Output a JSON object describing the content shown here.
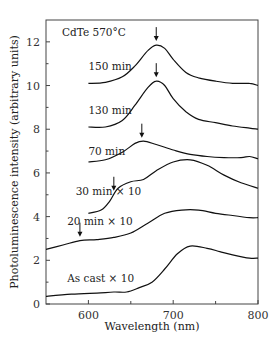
{
  "chart_data": {
    "type": "line",
    "title": "CdTe 570°C",
    "xlabel": "Wavelength (nm)",
    "ylabel": "Photoluminescence intensity (arbitrary units)",
    "xlim": [
      550,
      800
    ],
    "ylim": [
      0,
      13
    ],
    "xticks": [
      600,
      700,
      800
    ],
    "xminor": [
      650,
      750
    ],
    "yticks": [
      0,
      2,
      4,
      6,
      8,
      10,
      12
    ],
    "grid": false,
    "legend": "inline labels",
    "series": [
      {
        "name": "150 min",
        "label_pos": [
          600,
          10.7
        ],
        "x": [
          600,
          620,
          640,
          655,
          670,
          680,
          690,
          700,
          715,
          730,
          750,
          770,
          790,
          800
        ],
        "values": [
          10.1,
          10.15,
          10.4,
          10.9,
          11.6,
          11.85,
          11.7,
          11.2,
          10.6,
          10.35,
          10.2,
          10.1,
          10.1,
          10.0
        ],
        "arrow_x": 680
      },
      {
        "name": "130 min",
        "label_pos": [
          600,
          8.7
        ],
        "x": [
          600,
          620,
          640,
          655,
          670,
          680,
          690,
          700,
          715,
          730,
          750,
          770,
          790,
          800
        ],
        "values": [
          8.1,
          8.1,
          8.4,
          9.1,
          9.9,
          10.2,
          10.0,
          9.4,
          8.8,
          8.45,
          8.3,
          8.15,
          8.05,
          8.0
        ],
        "arrow_x": 680
      },
      {
        "name": "70 min",
        "label_pos": [
          600,
          6.8
        ],
        "x": [
          600,
          620,
          640,
          655,
          665,
          680,
          700,
          720,
          740,
          760,
          780,
          790,
          800
        ],
        "values": [
          6.5,
          6.6,
          6.95,
          7.35,
          7.45,
          7.3,
          7.05,
          6.85,
          6.75,
          6.7,
          6.7,
          6.75,
          6.65
        ],
        "arrow_x": 663
      },
      {
        "name": "30 min × 10",
        "label_pos": [
          585,
          5.0
        ],
        "x": [
          600,
          615,
          625,
          635,
          650,
          665,
          680,
          700,
          720,
          740,
          760,
          780,
          800
        ],
        "values": [
          4.15,
          4.3,
          4.7,
          5.3,
          5.6,
          5.7,
          6.1,
          6.5,
          6.6,
          6.35,
          5.9,
          5.55,
          5.3
        ],
        "arrow_x": 630
      },
      {
        "name": "20 min × 10",
        "label_pos": [
          575,
          3.6
        ],
        "x": [
          550,
          570,
          590,
          610,
          630,
          650,
          670,
          690,
          710,
          730,
          750,
          770,
          790,
          800
        ],
        "values": [
          2.5,
          2.7,
          2.9,
          2.95,
          3.05,
          3.25,
          3.7,
          4.15,
          4.3,
          4.3,
          4.15,
          4.05,
          3.95,
          3.95
        ],
        "arrow_x": 590
      },
      {
        "name": "As cast × 10",
        "label_pos": [
          575,
          1.0
        ],
        "x": [
          550,
          580,
          610,
          630,
          645,
          660,
          675,
          690,
          705,
          720,
          740,
          755,
          770,
          790,
          800
        ],
        "values": [
          0.35,
          0.45,
          0.5,
          0.55,
          0.55,
          0.75,
          1.0,
          1.6,
          2.3,
          2.65,
          2.55,
          2.4,
          2.25,
          2.1,
          2.1
        ],
        "arrow_x": null
      }
    ]
  },
  "labels": {
    "title": "CdTe 570°C",
    "xlabel": "Wavelength (nm)",
    "ylabel": "Photoluminescence intensity (arbitrary units)"
  }
}
